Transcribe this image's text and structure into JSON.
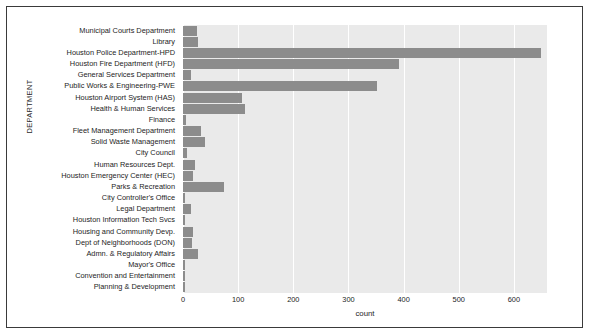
{
  "chart_data": {
    "type": "bar",
    "orientation": "horizontal",
    "title": "",
    "xlabel": "count",
    "ylabel": "DEPARTMENT",
    "xlim": [
      0,
      660
    ],
    "xticks": [
      0,
      100,
      200,
      300,
      400,
      500,
      600
    ],
    "xtick_labels": [
      "0",
      "100",
      "200",
      "300",
      "400",
      "500",
      "600"
    ],
    "grid": true,
    "grid_axis": "x",
    "legend": null,
    "bar_color": "#8c8c8c",
    "axes_bg": "#eaeaea",
    "categories": [
      "Municipal Courts Department",
      "Library",
      "Houston Police Department-HPD",
      "Houston Fire Department (HFD)",
      "General Services Department",
      "Public Works & Engineering-PWE",
      "Houston Airport System (HAS)",
      "Health & Human Services",
      "Finance",
      "Fleet Management Department",
      "Solid Waste Management",
      "City Council",
      "Human Resources Dept.",
      "Houston Emergency Center (HEC)",
      "Parks & Recreation",
      "City Controller's Office",
      "Legal Department",
      "Houston Information Tech Svcs",
      "Housing and Community Devp.",
      "Dept of Neighborhoods (DON)",
      "Admn. & Regulatory Affairs",
      "Mayor's Office",
      "Convention and Entertainment",
      "Planning & Development"
    ],
    "values": [
      25,
      28,
      649,
      391,
      15,
      352,
      107,
      112,
      6,
      32,
      40,
      8,
      22,
      18,
      74,
      3,
      15,
      3,
      19,
      17,
      28,
      2,
      1,
      3
    ]
  }
}
